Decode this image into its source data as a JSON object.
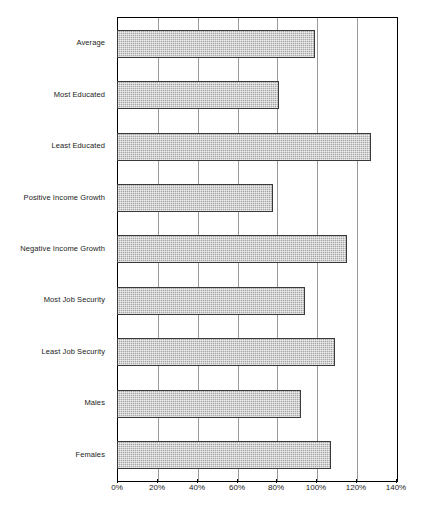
{
  "chart_data": {
    "type": "bar",
    "orientation": "horizontal",
    "title": "",
    "subtitle": "",
    "xlabel": "",
    "ylabel": "",
    "categories": [
      "Average",
      "Most Educated",
      "Least Educated",
      "Positive Income Growth",
      "Negative Income Growth",
      "Most Job Security",
      "Least Job Security",
      "Males",
      "Females"
    ],
    "values": [
      99,
      81,
      127,
      78,
      115,
      94,
      109,
      92,
      107
    ],
    "value_suffix": "%",
    "xlim": [
      0,
      140
    ],
    "tick_labels": [
      "0%",
      "20%",
      "40%",
      "60%",
      "80%",
      "100%",
      "120%",
      "140%"
    ],
    "tick_values": [
      0,
      20,
      40,
      60,
      80,
      100,
      120,
      140
    ],
    "grid": true,
    "legend": null,
    "legend_position": "none",
    "series": [
      {
        "name": "",
        "values": [
          99,
          81,
          127,
          78,
          115,
          94,
          109,
          92,
          107
        ]
      }
    ],
    "colors": {
      "bar_fill": "#a6a6a6",
      "bar_border": "#3a3a3a",
      "gridline": "#9a9a9a",
      "axis": "#000000",
      "background": "#ffffff",
      "text": "#1a1a1a"
    }
  }
}
